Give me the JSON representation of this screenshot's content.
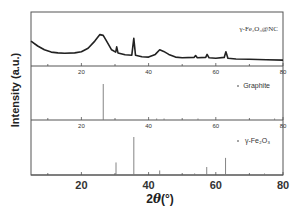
{
  "chart_data": {
    "type": "line",
    "title": "",
    "xlabel": "2θ (°)",
    "ylabel": "Intensity (a.u.)",
    "xlim": [
      5,
      80
    ],
    "x_ticks": [
      20,
      40,
      60,
      80
    ],
    "grid": false,
    "panels": [
      {
        "name": "γ-Fe2O3@NC",
        "type": "line",
        "legend": "γ-Fe₂O₃@NC",
        "tick_labels": [
          "20",
          "40",
          "60",
          "80"
        ],
        "points": [
          [
            5,
            0.55
          ],
          [
            7,
            0.42
          ],
          [
            9,
            0.32
          ],
          [
            11,
            0.26
          ],
          [
            13,
            0.24
          ],
          [
            15,
            0.23
          ],
          [
            18,
            0.24
          ],
          [
            20,
            0.27
          ],
          [
            22,
            0.36
          ],
          [
            24,
            0.55
          ],
          [
            25.5,
            0.72
          ],
          [
            26.5,
            0.7
          ],
          [
            27.5,
            0.55
          ],
          [
            29,
            0.32
          ],
          [
            30.2,
            0.26
          ],
          [
            30.5,
            0.4
          ],
          [
            30.9,
            0.24
          ],
          [
            33,
            0.19
          ],
          [
            35,
            0.18
          ],
          [
            35.6,
            0.62
          ],
          [
            36.1,
            0.18
          ],
          [
            38,
            0.14
          ],
          [
            40,
            0.13
          ],
          [
            42,
            0.2
          ],
          [
            43.3,
            0.32
          ],
          [
            44.5,
            0.28
          ],
          [
            46,
            0.2
          ],
          [
            48,
            0.13
          ],
          [
            50,
            0.11
          ],
          [
            53.5,
            0.12
          ],
          [
            54,
            0.17
          ],
          [
            54.5,
            0.11
          ],
          [
            57,
            0.12
          ],
          [
            57.4,
            0.2
          ],
          [
            58,
            0.11
          ],
          [
            60,
            0.1
          ],
          [
            62.5,
            0.12
          ],
          [
            63,
            0.27
          ],
          [
            63.6,
            0.1
          ],
          [
            66,
            0.08
          ],
          [
            70,
            0.07
          ],
          [
            75,
            0.06
          ],
          [
            80,
            0.05
          ]
        ]
      },
      {
        "name": "Graphite",
        "type": "stem",
        "legend": "Graphite",
        "tick_labels": [
          "20",
          "40",
          "60",
          "80"
        ],
        "peaks": [
          {
            "x": 26.5,
            "y": 1.0
          },
          {
            "x": 42.4,
            "y": 0.02
          },
          {
            "x": 44.6,
            "y": 0.04
          },
          {
            "x": 54.7,
            "y": 0.04
          },
          {
            "x": 77.5,
            "y": 0.02
          }
        ]
      },
      {
        "name": "γ-Fe2O3",
        "type": "stem",
        "legend": "γ-Fe₂O₃",
        "tick_labels": [
          "20",
          "40",
          "60",
          "80"
        ],
        "peaks": [
          {
            "x": 30.3,
            "y": 0.33
          },
          {
            "x": 35.6,
            "y": 1.0
          },
          {
            "x": 43.3,
            "y": 0.12
          },
          {
            "x": 53.7,
            "y": 0.04
          },
          {
            "x": 57.3,
            "y": 0.21
          },
          {
            "x": 62.9,
            "y": 0.45
          },
          {
            "x": 74.5,
            "y": 0.02
          }
        ]
      }
    ]
  },
  "axis": {
    "ylabel": "Intensity (a.u.)",
    "xlabel_prefix": "2",
    "xlabel_theta": "θ",
    "xlabel_suffix": "(°)",
    "bottom_ticks": [
      "20",
      "40",
      "60",
      "80"
    ]
  },
  "colors": {
    "frame": "#555555",
    "trace": "#222222",
    "stem": "#777777",
    "text": "#333333"
  }
}
